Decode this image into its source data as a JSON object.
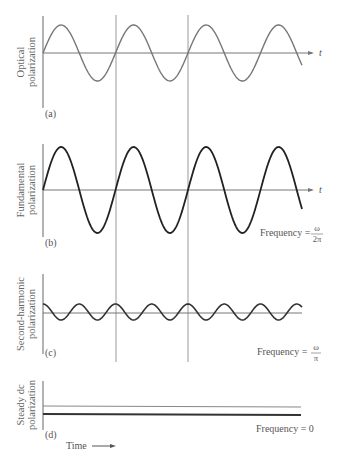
{
  "figure": {
    "time_axis_label": "t",
    "time_footer": "Time",
    "panels": [
      {
        "id": "a",
        "tag": "(a)",
        "ylabel_lines": [
          "Optical",
          "polarization"
        ],
        "frequency_label": "",
        "waveform": "sine",
        "stroke_color": "#777777"
      },
      {
        "id": "b",
        "tag": "(b)",
        "ylabel_lines": [
          "Fundamental",
          "polarization"
        ],
        "frequency_label": "Frequency =",
        "frequency_num": "ω",
        "frequency_den": "2π",
        "waveform": "sine",
        "stroke_color": "#222222"
      },
      {
        "id": "c",
        "tag": "(c)",
        "ylabel_lines": [
          "Second-harmonic",
          "polarization"
        ],
        "frequency_label": "Frequency =",
        "frequency_num": "ω",
        "frequency_den": "π",
        "waveform": "cosine-half-period",
        "stroke_color": "#333333"
      },
      {
        "id": "d",
        "tag": "(d)",
        "ylabel_lines": [
          "Steady dc",
          "polarization"
        ],
        "frequency_label": "Frequency = 0",
        "waveform": "constant",
        "stroke_color": "#333333"
      }
    ]
  }
}
